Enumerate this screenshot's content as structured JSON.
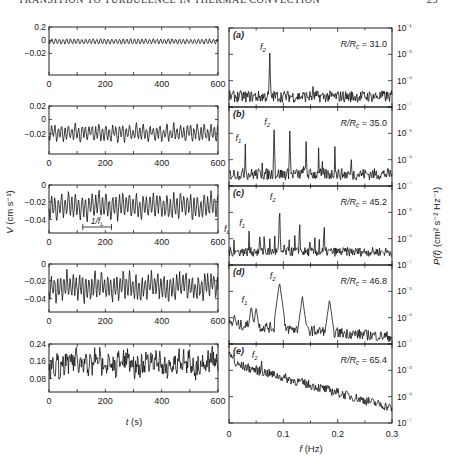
{
  "header": {
    "running_title": "TRANSITION TO TURBULENCE IN THERMAL CONVECTION",
    "page_number": "23"
  },
  "chart_data": [
    {
      "type": "line",
      "panel": "time-series-a",
      "xlim": [
        0,
        600
      ],
      "xticks": [
        "0",
        "200",
        "400",
        "600"
      ],
      "yticks": [
        "0.2",
        "0",
        "−0.02"
      ],
      "ytick_pos": [
        0.0,
        0.28,
        0.55
      ],
      "signal": {
        "mean": 0.3,
        "amp": 0.05,
        "freq": 0.075,
        "noise": 0.01,
        "harm": 0.0,
        "low": 0.0
      }
    },
    {
      "type": "line",
      "panel": "time-series-b",
      "xlim": [
        0,
        600
      ],
      "xticks": [
        "0",
        "200",
        "400",
        "600"
      ],
      "yticks": [
        "0.02",
        "0",
        "−0.02"
      ],
      "ytick_pos": [
        0.0,
        0.28,
        0.58
      ],
      "signal": {
        "mean": 0.56,
        "amp": 0.13,
        "freq": 0.083,
        "noise": 0.04,
        "harm": 0.05,
        "low": 0.0
      }
    },
    {
      "type": "line",
      "panel": "time-series-c",
      "xlim": [
        0,
        600
      ],
      "xticks": [
        "0",
        "200",
        "400",
        "600"
      ],
      "yticks": [
        "0",
        "−0.02",
        "−0.04"
      ],
      "ytick_pos": [
        0.0,
        0.35,
        0.72
      ],
      "signal": {
        "mean": 0.44,
        "amp": 0.2,
        "freq": 0.083,
        "noise": 0.05,
        "harm": 0.06,
        "low": 0.04
      },
      "annotation": {
        "text": "1/f",
        "sub": "L",
        "x0": 120,
        "x1": 222
      }
    },
    {
      "type": "line",
      "panel": "time-series-d",
      "xlim": [
        0,
        600
      ],
      "xticks": [
        "0",
        "200",
        "400",
        "600"
      ],
      "yticks": [
        "0",
        "−0.02",
        "−0.04"
      ],
      "ytick_pos": [
        0.0,
        0.35,
        0.72
      ],
      "signal": {
        "mean": 0.47,
        "amp": 0.2,
        "freq": 0.09,
        "noise": 0.07,
        "harm": 0.06,
        "low": 0.05
      }
    },
    {
      "type": "line",
      "panel": "time-series-e",
      "xlim": [
        0,
        600
      ],
      "xticks": [
        "0",
        "200",
        "400",
        "600"
      ],
      "yticks": [
        "0.24",
        "0.16",
        "0.08"
      ],
      "ytick_pos": [
        0.0,
        0.35,
        0.72
      ],
      "xlabel": "t",
      "xlabel_unit": "(s)",
      "signal": {
        "mean": 0.4,
        "amp": 0.1,
        "freq": 0.06,
        "noise": 0.2,
        "harm": 0.04,
        "low": 0.06
      }
    },
    {
      "type": "line",
      "panel": "spectrum-a",
      "label": "(a)",
      "ratio": "R/R",
      "ratio_sub": "c",
      "ratio_value": "= 31.0",
      "xlim": [
        0,
        0.3
      ],
      "ylim_log10": [
        -7,
        -1
      ],
      "floor": -6.2,
      "noise": 0.45,
      "slope": 0,
      "peaks": [
        {
          "f": 0.075,
          "logP": -2.9,
          "label": "f",
          "sub": "2"
        },
        {
          "f": 0.155,
          "logP": -4.8
        }
      ]
    },
    {
      "type": "line",
      "panel": "spectrum-b",
      "label": "(b)",
      "ratio": "R/R",
      "ratio_sub": "c",
      "ratio_value": "= 35.0",
      "xlim": [
        0,
        0.3
      ],
      "ylim_log10": [
        -7,
        -1
      ],
      "floor": -6.1,
      "noise": 0.45,
      "slope": 0,
      "peaks": [
        {
          "f": 0.03,
          "logP": -3.8,
          "label": "f",
          "sub": "1"
        },
        {
          "f": 0.061,
          "logP": -5.0
        },
        {
          "f": 0.083,
          "logP": -2.6,
          "label": "f",
          "sub": "2"
        },
        {
          "f": 0.112,
          "logP": -2.7
        },
        {
          "f": 0.137,
          "logP": -5.0
        },
        {
          "f": 0.142,
          "logP": -3.5
        },
        {
          "f": 0.165,
          "logP": -4.1
        },
        {
          "f": 0.172,
          "logP": -5.0
        },
        {
          "f": 0.195,
          "logP": -4.0
        },
        {
          "f": 0.225,
          "logP": -5.0
        }
      ]
    },
    {
      "type": "line",
      "panel": "spectrum-c",
      "label": "(c)",
      "ratio": "R/R",
      "ratio_sub": "c",
      "ratio_value": "= 45.2",
      "xlim": [
        0,
        0.3
      ],
      "ylim_log10": [
        -7,
        -1
      ],
      "floor": -6.0,
      "noise": 0.35,
      "slope": 0,
      "peaks": [
        {
          "f": 0.009,
          "logP": -4.7,
          "label": "f",
          "sub": "L"
        },
        {
          "f": 0.018,
          "logP": -5.3
        },
        {
          "f": 0.028,
          "logP": -5.3
        },
        {
          "f": 0.037,
          "logP": -4.3,
          "label": "f",
          "sub": "1"
        },
        {
          "f": 0.047,
          "logP": -5.3
        },
        {
          "f": 0.057,
          "logP": -4.1
        },
        {
          "f": 0.065,
          "logP": -4.2
        },
        {
          "f": 0.075,
          "logP": -5.0
        },
        {
          "f": 0.084,
          "logP": -4.4
        },
        {
          "f": 0.093,
          "logP": -2.3,
          "label": "f",
          "sub": "2"
        },
        {
          "f": 0.102,
          "logP": -4.7
        },
        {
          "f": 0.111,
          "logP": -4.7
        },
        {
          "f": 0.121,
          "logP": -4.5
        },
        {
          "f": 0.13,
          "logP": -3.3
        },
        {
          "f": 0.139,
          "logP": -5.3
        },
        {
          "f": 0.149,
          "logP": -5.0
        },
        {
          "f": 0.158,
          "logP": -4.8
        },
        {
          "f": 0.166,
          "logP": -4.8
        },
        {
          "f": 0.175,
          "logP": -3.5
        },
        {
          "f": 0.185,
          "logP": -5.2
        },
        {
          "f": 0.205,
          "logP": -5.5
        }
      ]
    },
    {
      "type": "line",
      "panel": "spectrum-d",
      "label": "(d)",
      "ratio": "R/R",
      "ratio_sub": "c",
      "ratio_value": "= 46.8",
      "xlim": [
        0,
        0.3
      ],
      "ylim_log10": [
        -7,
        -1
      ],
      "floor": -5.5,
      "noise": 0.4,
      "slope": -3.2,
      "peaks": [
        {
          "f": 0.01,
          "logP": -4.7
        },
        {
          "f": 0.041,
          "logP": -4.1,
          "label": "f",
          "sub": "1"
        },
        {
          "f": 0.05,
          "logP": -4.2
        },
        {
          "f": 0.093,
          "logP": -2.3,
          "label": "f",
          "sub": "2"
        },
        {
          "f": 0.135,
          "logP": -3.4
        },
        {
          "f": 0.185,
          "logP": -3.6
        }
      ]
    },
    {
      "type": "line",
      "panel": "spectrum-e",
      "label": "(e)",
      "ratio": "R/R",
      "ratio_sub": "c",
      "ratio_value": "= 65.4",
      "xlabel": "f",
      "xlabel_unit": "(Hz)",
      "xticks": [
        "0",
        "0.1",
        "0.2",
        "0.3"
      ],
      "yticks_right": [
        "10⁻¹",
        "10⁻³",
        "10⁻⁵",
        "10⁻⁷"
      ],
      "ylabel": "P(f)",
      "ylabel_unit": "(cm² s⁻² Hz⁻¹)",
      "xlim": [
        0,
        0.3
      ],
      "ylim_log10": [
        -7,
        -1
      ],
      "floor": -2.4,
      "noise": 0.35,
      "slope": -11.5,
      "peaks": [
        {
          "f": 0.06,
          "logP": -2.3,
          "label": "f",
          "sub": "2"
        }
      ]
    }
  ],
  "axes": {
    "left_ylabel": "V",
    "left_ylabel_unit": "(cm s⁻¹)",
    "left_xlabel": "t",
    "left_xlabel_unit": "(s)",
    "right_xlabel": "f",
    "right_xlabel_unit": "(Hz)",
    "right_ylabel": "P(f)",
    "right_ylabel_unit": "(cm² s⁻² Hz⁻¹)",
    "right_xticks": [
      "0",
      "0.1",
      "0.2",
      "0.3"
    ],
    "right_yticks": [
      "10⁻¹",
      "10⁻³",
      "10⁻⁵",
      "10⁻⁷"
    ],
    "left_xticks": [
      "0",
      "200",
      "400",
      "600"
    ]
  }
}
